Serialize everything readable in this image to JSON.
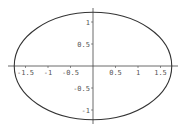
{
  "chart_data": {
    "type": "line",
    "title": "",
    "xlabel": "",
    "ylabel": "",
    "series": [
      {
        "name": "ellipse",
        "semi_axis_x": 1.75,
        "semi_axis_y": 1.22,
        "center": [
          0,
          0
        ]
      }
    ],
    "xlim": [
      -1.8,
      1.8
    ],
    "ylim": [
      -1.25,
      1.25
    ],
    "x_ticks": [
      -1.5,
      -1,
      -0.5,
      0.5,
      1,
      1.5
    ],
    "x_tick_labels": [
      "-1.5",
      "-1",
      "-0.5",
      "0.5",
      "1",
      "1.5"
    ],
    "y_ticks": [
      1,
      0.5,
      -0.5,
      -1
    ],
    "y_tick_labels": [
      "1",
      "0.5",
      "-0.5",
      "-1"
    ],
    "grid": false,
    "legend": "none"
  }
}
